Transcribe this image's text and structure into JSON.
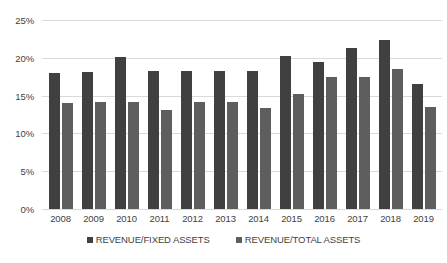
{
  "chart_data": {
    "type": "bar",
    "title": "",
    "subtitle": "",
    "xlabel": "",
    "ylabel": "",
    "categories": [
      "2008",
      "2009",
      "2010",
      "2011",
      "2012",
      "2013",
      "2014",
      "2015",
      "2016",
      "2017",
      "2018",
      "2019"
    ],
    "series": [
      {
        "name": "REVENUE/FIXED ASSETS",
        "color": "#404040",
        "values": [
          18.0,
          18.1,
          20.1,
          18.2,
          18.2,
          18.2,
          18.3,
          20.3,
          19.4,
          21.3,
          22.4,
          16.5
        ]
      },
      {
        "name": "REVENUE/TOTAL ASSETS",
        "color": "#5e5e5e",
        "values": [
          14.0,
          14.1,
          14.1,
          13.1,
          14.2,
          14.2,
          13.3,
          15.2,
          17.4,
          17.5,
          18.5,
          13.5
        ]
      }
    ],
    "ylim": [
      0,
      25
    ],
    "y_ticks": [
      0,
      5,
      10,
      15,
      20,
      25
    ],
    "y_tick_labels": [
      "0%",
      "5%",
      "10%",
      "15%",
      "20%",
      "25%"
    ],
    "grid": true,
    "grid_color": "#d9d9d9",
    "legend_position": "bottom",
    "background": "#ffffff",
    "value_suffix": "%"
  }
}
